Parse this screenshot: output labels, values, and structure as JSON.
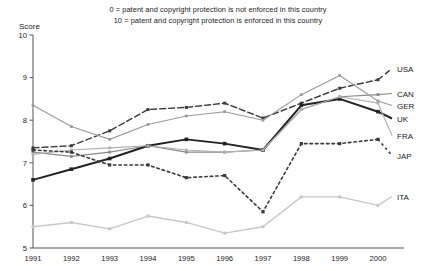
{
  "subtitle": {
    "line1": "0 = patent and copyright protection is not enforced in this country",
    "line2": "10 = patent and copyright protection is enforced in this country"
  },
  "axis": {
    "y_title": "Score",
    "y_ticks": [
      "10",
      "9",
      "8",
      "7",
      "6",
      "5"
    ],
    "x_ticks": [
      "1991",
      "1992",
      "1993",
      "1994",
      "1995",
      "1996",
      "1997",
      "1998",
      "1999",
      "2000"
    ]
  },
  "legend": [
    {
      "label": "USA",
      "color": "#3a3a3a"
    },
    {
      "label": "CAN",
      "color": "#8a8a8a"
    },
    {
      "label": "GER",
      "color": "#9a9a9a"
    },
    {
      "label": "UK",
      "color": "#222222"
    },
    {
      "label": "FRA",
      "color": "#b0b0b0"
    },
    {
      "label": "JAP",
      "color": "#3a3a3a"
    },
    {
      "label": "ITA",
      "color": "#c8c8c8"
    }
  ],
  "chart_data": {
    "type": "line",
    "title": "",
    "subtitle": "0 = patent and copyright protection is not enforced in this country / 10 = patent and copyright protection is enforced in this country",
    "xlabel": "",
    "ylabel": "Score",
    "categories": [
      "1991",
      "1992",
      "1993",
      "1994",
      "1995",
      "1996",
      "1997",
      "1998",
      "1999",
      "2000"
    ],
    "ylim": [
      5,
      10
    ],
    "y_ticks": [
      5,
      6,
      7,
      8,
      9,
      10
    ],
    "grid": false,
    "legend_position": "right",
    "series": [
      {
        "name": "USA",
        "color": "#3a3a3a",
        "style": "dashed",
        "width": 1.4,
        "marker": "square",
        "values": [
          7.35,
          7.4,
          7.75,
          8.25,
          8.3,
          8.4,
          8.05,
          8.4,
          8.75,
          8.95
        ]
      },
      {
        "name": "CAN",
        "color": "#8a8a8a",
        "style": "solid",
        "width": 1.2,
        "marker": "square",
        "values": [
          7.25,
          7.15,
          7.25,
          7.4,
          7.25,
          7.25,
          7.3,
          8.25,
          8.55,
          8.6
        ]
      },
      {
        "name": "GER",
        "color": "#9a9a9a",
        "style": "solid",
        "width": 1.1,
        "marker": "square",
        "values": [
          8.35,
          7.85,
          7.55,
          7.9,
          8.1,
          8.2,
          8.0,
          8.6,
          9.05,
          8.45
        ]
      },
      {
        "name": "UK",
        "color": "#222222",
        "style": "solid",
        "width": 2.0,
        "marker": "square",
        "values": [
          6.6,
          6.85,
          7.1,
          7.4,
          7.55,
          7.45,
          7.3,
          8.35,
          8.5,
          8.2
        ]
      },
      {
        "name": "FRA",
        "color": "#b0b0b0",
        "style": "solid",
        "width": 1.2,
        "marker": "square",
        "values": [
          7.2,
          7.3,
          7.35,
          7.4,
          7.3,
          7.25,
          7.3,
          8.25,
          8.55,
          8.4
        ]
      },
      {
        "name": "JAP",
        "color": "#3a3a3a",
        "style": "dotted",
        "width": 1.6,
        "marker": "square",
        "values": [
          7.3,
          7.25,
          6.95,
          6.95,
          6.65,
          6.7,
          5.85,
          7.45,
          7.45,
          7.55
        ]
      },
      {
        "name": "ITA",
        "color": "#c8c8c8",
        "style": "solid",
        "width": 1.4,
        "marker": "square",
        "values": [
          5.5,
          5.6,
          5.45,
          5.75,
          5.6,
          5.35,
          5.5,
          6.2,
          6.2,
          6.0
        ]
      }
    ]
  }
}
